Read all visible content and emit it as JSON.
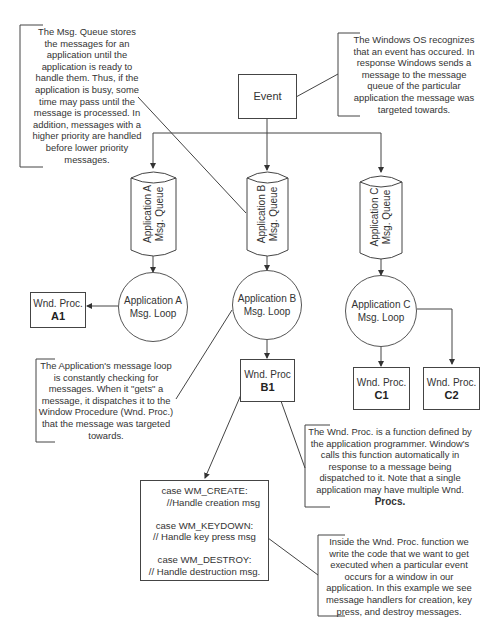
{
  "notes": {
    "msg_queue": "The Msg. Queue stores\nthe messages for an\napplication until the\napplication is ready to\nhandle them.  Thus, if the\napplication is busy, some\ntime may pass until the\nmessage is processed.  In\naddition, messages with a\nhigher priority are handled\nbefore lower priority\nmessages.",
    "windows_os": "The Windows OS recognizes\nthat an event has occured.  In\nresponse Windows sends a\nmessage to the message\nqueue of the particular\napplication the message was\ntargeted towards.",
    "msg_loop": "The Application's message loop\nis constantly checking for\nmessages.  When it \"gets\" a\nmessage, it dispatches it to the\nWindow Procedure (Wnd. Proc.)\nthat the message was targeted\ntowards.",
    "wnd_proc": "The Wnd. Proc. is a function defined by\nthe application programmer.  Window's\ncalls this function automatically in\nresponse to a message being\ndispatched to it.  Note that a single\napplication may have multiple Wnd.",
    "wnd_proc_bold": "Procs.",
    "inside_wnd_proc": "Inside the Wnd. Proc. function we\nwrite the code that we want to get\nexecuted when a particular event\noccurs for a window in our\napplication.  In this example we see\nmessage handlers for creation, key\npress, and destroy messages."
  },
  "event": {
    "label": "Event"
  },
  "queues": [
    {
      "line1": "Application A",
      "line2": "Msg. Queue"
    },
    {
      "line1": "Application B",
      "line2": "Msg. Queue"
    },
    {
      "line1": "Application C",
      "line2": "Msg. Queue"
    }
  ],
  "loops": [
    {
      "line1": "Application A",
      "line2": "Msg. Loop"
    },
    {
      "line1": "Application B",
      "line2": "Msg. Loop"
    },
    {
      "line1": "Application C",
      "line2": "Msg. Loop"
    }
  ],
  "procs": [
    {
      "label": "Wnd. Proc.",
      "id": "A1"
    },
    {
      "label": "Wnd. Proc",
      "id": "B1"
    },
    {
      "label": "Wnd. Proc.",
      "id": "C1"
    },
    {
      "label": "Wnd. Proc.",
      "id": "C2"
    }
  ],
  "code": [
    "case WM_CREATE:",
    "   //Handle creation msg",
    "case WM_KEYDOWN:",
    "  // Handle key press msg",
    "case WM_DESTROY:",
    "// Handle destruction msg."
  ]
}
